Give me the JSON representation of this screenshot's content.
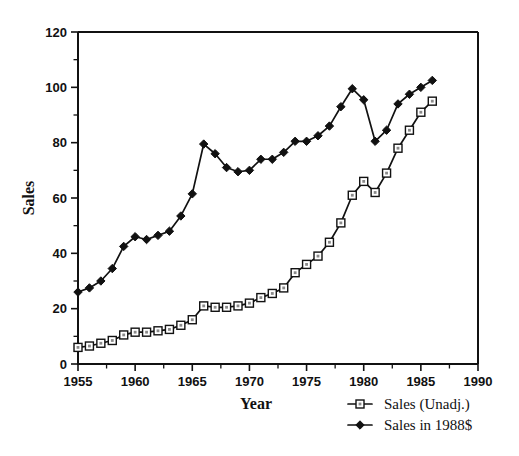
{
  "chart_data": {
    "type": "line",
    "title": "",
    "xlabel": "Year",
    "ylabel": "Sales",
    "xlim": [
      1955,
      1990
    ],
    "ylim": [
      0,
      120
    ],
    "xticks": [
      1955,
      1960,
      1965,
      1970,
      1975,
      1980,
      1985,
      1990
    ],
    "xtick_labels": [
      "1955",
      "1960",
      "1965",
      "1970",
      "1975",
      "1980",
      "1985",
      "1990"
    ],
    "x_minor_step": 2.5,
    "yticks": [
      0,
      20,
      40,
      60,
      80,
      100,
      120
    ],
    "ytick_labels": [
      "0",
      "20",
      "40",
      "60",
      "80",
      "100",
      "120"
    ],
    "y_minor_step": 10,
    "grid": false,
    "legend_position": "below-right",
    "x": [
      1955,
      1956,
      1957,
      1958,
      1959,
      1960,
      1961,
      1962,
      1963,
      1964,
      1965,
      1966,
      1967,
      1968,
      1969,
      1970,
      1971,
      1972,
      1973,
      1974,
      1975,
      1976,
      1977,
      1978,
      1979,
      1980,
      1981,
      1982,
      1983,
      1984,
      1985,
      1986
    ],
    "series": [
      {
        "name": "Sales (Unadj.)",
        "marker": "open-square",
        "color": "#111111",
        "values": [
          6,
          6.5,
          7.5,
          8.5,
          10.5,
          11.5,
          11.5,
          12,
          12.5,
          14,
          16,
          21,
          20.5,
          20.5,
          21,
          22,
          24,
          25.5,
          27.5,
          33,
          36,
          39,
          44,
          51,
          61,
          66,
          62,
          69,
          78,
          84.5,
          91,
          95
        ]
      },
      {
        "name": "Sales in 1988$",
        "marker": "filled-diamond",
        "color": "#111111",
        "values": [
          26,
          27.5,
          30,
          34.5,
          42.5,
          46,
          45,
          46.5,
          48,
          53.5,
          61.5,
          79.5,
          76,
          71,
          69.5,
          70,
          74,
          74,
          76.5,
          80.5,
          80.5,
          82.5,
          86,
          93,
          99.5,
          95.5,
          80.5,
          84.5,
          94,
          97.5,
          100,
          102.5
        ]
      }
    ],
    "legend": [
      {
        "label": "Sales (Unadj.)",
        "marker": "open-square"
      },
      {
        "label": "Sales in 1988$",
        "marker": "filled-diamond"
      }
    ]
  }
}
